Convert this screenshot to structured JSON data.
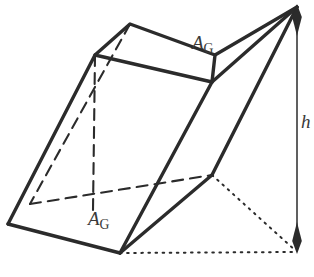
{
  "figure": {
    "kind": "oblique-prism-geometry-diagram",
    "background_color": "#ffffff",
    "stroke_color": "#2b2b2b",
    "label_color": "#3a3a3a",
    "labels": {
      "top_face_area": {
        "base": "A",
        "subscript": "G"
      },
      "bottom_face_area": {
        "base": "A",
        "subscript": "G"
      },
      "height": "h"
    },
    "line_styles": {
      "visible_edge": "solid",
      "hidden_edge": "dashed",
      "projection": "dotted",
      "dimension": "double-arrow"
    },
    "vertices": {
      "top_back_left": [
        130,
        24
      ],
      "top_front_left": [
        95,
        55
      ],
      "top_back_right": [
        215,
        55
      ],
      "top_front_right": [
        212,
        82
      ],
      "bottom_back_left": [
        30,
        204
      ],
      "bottom_front_left": [
        8,
        224
      ],
      "bottom_front_mid": [
        120,
        253
      ],
      "bottom_right": [
        212,
        175
      ],
      "apex_right": [
        297,
        6
      ],
      "ground_corner": [
        297,
        252
      ]
    },
    "dimension_line": {
      "label": "h",
      "x": 297,
      "y_top": 10,
      "y_bottom": 250,
      "arrowheads": "both"
    }
  }
}
